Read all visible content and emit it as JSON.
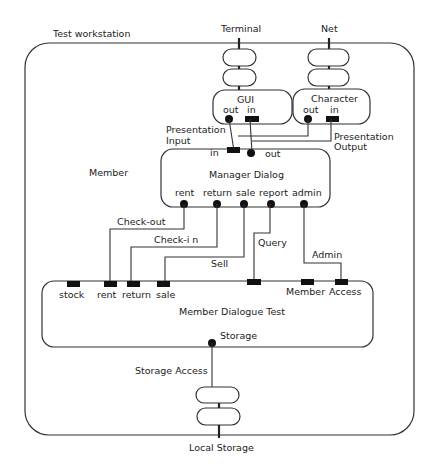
{
  "diagram": {
    "title": "Test workstation",
    "external_interfaces": {
      "terminal": "Terminal",
      "net": "Net",
      "local_storage": "Local Storage"
    },
    "gui": {
      "label": "GUI",
      "out": "out",
      "in": "in"
    },
    "character": {
      "label": "Character",
      "out": "out",
      "in": "in"
    },
    "presentation_input": [
      "Presentation",
      "Input"
    ],
    "presentation_output": [
      "Presentation",
      "Output"
    ],
    "member_label": "Member",
    "manager_dialog": {
      "label": "Manager Dialog",
      "in": "in",
      "out": "out",
      "ports": [
        "rent",
        "return",
        "sale",
        "report",
        "admin"
      ]
    },
    "connections": {
      "checkout": "Check-out",
      "checkin": "Check-i n",
      "sell": "Sell",
      "query": "Query",
      "admin": "Admin",
      "storage_access": "Storage Access"
    },
    "member_dialogue_test": {
      "label": "Member Dialogue Test",
      "ports": [
        "stock",
        "rent",
        "return",
        "sale",
        "Member",
        "Access"
      ],
      "storage": "Storage"
    }
  },
  "colors": {
    "stroke": "#333333",
    "port": "#111111",
    "background": "#ffffff"
  }
}
